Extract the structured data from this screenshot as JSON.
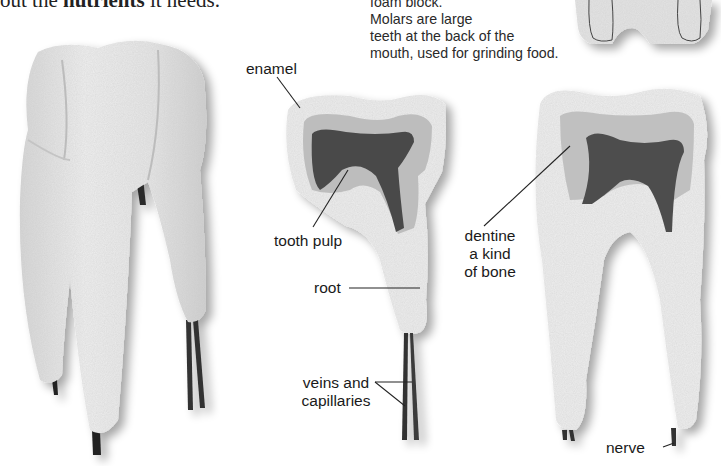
{
  "intro_text": {
    "prefix": "out the ",
    "bold": "nutrients",
    "suffix": " it needs."
  },
  "caption": {
    "lines": [
      "foam block.",
      "Molars are large",
      "teeth at the back of the",
      "mouth, used for grinding food."
    ]
  },
  "figures": [
    {
      "name": "whole-molar-model",
      "description": "Foam model of a whole molar with three roots"
    },
    {
      "name": "cross-section-half",
      "description": "Cut section of molar showing enamel, dentine, pulp"
    },
    {
      "name": "cross-section-full",
      "description": "Full molar cross-section with two roots"
    },
    {
      "name": "molar-top-cropped",
      "description": "Top of foam molar block, cropped"
    }
  ],
  "labels": {
    "enamel": "enamel",
    "tooth_pulp": "tooth pulp",
    "root": "root",
    "veins_line1": "veins and",
    "veins_line2": "capillaries",
    "dentine": "dentine",
    "dentine_desc1": "a kind",
    "dentine_desc2": "of bone",
    "nerve": "nerve"
  },
  "colors": {
    "foam": "#ebebeb",
    "foam_shadow": "#c8c8c8",
    "dentine": "#b9b9b9",
    "pulp": "#4a4a4a",
    "vessel": "#2e2e2e",
    "leader": "#222222"
  }
}
